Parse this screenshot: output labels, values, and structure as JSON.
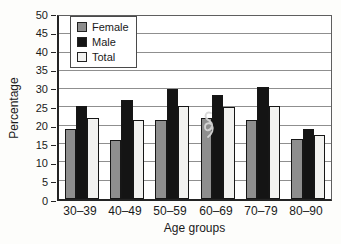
{
  "figure": {
    "background": "#fdfdfb",
    "plot_background": "#ffffff",
    "gridline_color": "#8f8f8f",
    "axis_color": "#232323"
  },
  "chart_data": {
    "type": "bar",
    "title": "",
    "xlabel": "Age groups",
    "ylabel": "Percentage",
    "ylim": [
      0,
      50
    ],
    "ytick_step": 5,
    "yticks": [
      0,
      5,
      10,
      15,
      20,
      25,
      30,
      35,
      40,
      45,
      50
    ],
    "grid": "horizontal",
    "legend_position": "top-left-inside",
    "categories": [
      "30–39",
      "40–49",
      "50–59",
      "60–69",
      "70–79",
      "80–90"
    ],
    "series": [
      {
        "name": "Female",
        "color": "#8e8e8e",
        "values": [
          19,
          16,
          21.5,
          22,
          21.5,
          16.5
        ]
      },
      {
        "name": "Male",
        "color": "#141414",
        "values": [
          25.5,
          27,
          30,
          28.5,
          30.5,
          19
        ]
      },
      {
        "name": "Total",
        "color": "#f2f2f0",
        "values": [
          22,
          21.5,
          25.5,
          25,
          25.5,
          17.5
        ]
      }
    ],
    "bar_border_color": "#161616",
    "annotations": [
      {
        "type": "scribble",
        "description": "faint handwritten 8-shaped pen mark over the 60–69 male bar",
        "color": "#d6d6d6"
      }
    ]
  }
}
